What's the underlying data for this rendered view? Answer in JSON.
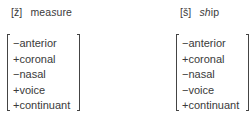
{
  "columns": [
    {
      "symbol": "[ž]",
      "word_plain_prefix": "mea",
      "word_italic": "s",
      "word_plain_suffix": "ure",
      "features": [
        "−anterior",
        "+coronal",
        "−nasal",
        "+voice",
        "+continuant"
      ]
    },
    {
      "symbol": "[š]",
      "word_plain_prefix": "",
      "word_italic": "sh",
      "word_plain_suffix": "ip",
      "features": [
        "−anterior",
        "+coronal",
        "−nasal",
        "−voice",
        "+continuant"
      ]
    }
  ]
}
